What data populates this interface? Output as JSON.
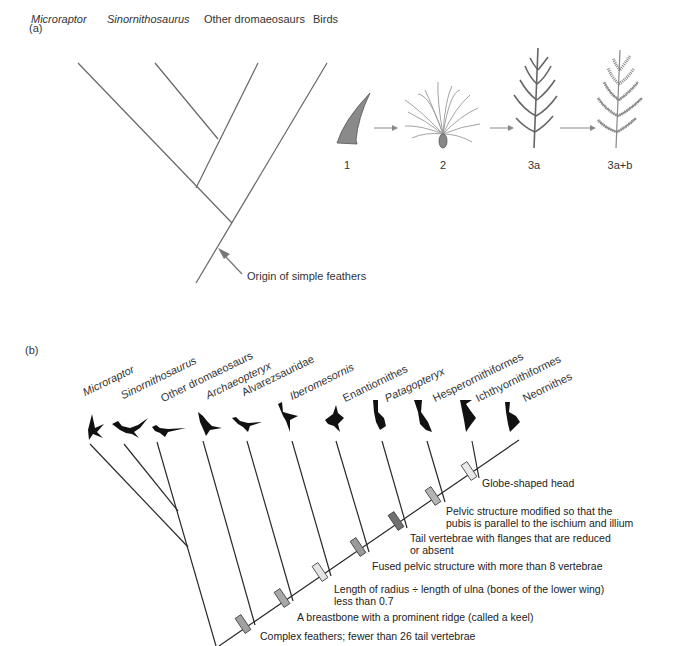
{
  "panel_a": {
    "label": "(a)",
    "taxa": [
      {
        "name": "Microraptor",
        "italic": true
      },
      {
        "name": "Sinornithosaurus",
        "italic": true
      },
      {
        "name": "Other dromaeosaurs",
        "italic": false
      },
      {
        "name": "Birds",
        "italic": false
      }
    ],
    "annotation": "Origin of simple feathers",
    "feather_stages": [
      {
        "label": "1",
        "icon": "horn-like-filament-icon"
      },
      {
        "label": "2",
        "icon": "tuft-of-barbs-icon"
      },
      {
        "label": "3a",
        "icon": "rachis-with-barbs-icon"
      },
      {
        "label": "3a+b",
        "icon": "rachis-barbs-barbules-icon"
      }
    ]
  },
  "panel_b": {
    "label": "(b)",
    "taxa": [
      {
        "name": "Microraptor",
        "italic": true
      },
      {
        "name": "Sinornithosaurus",
        "italic": true
      },
      {
        "name": "Other dromaeosaurs",
        "italic": false
      },
      {
        "name": "Archaeopteryx",
        "italic": true
      },
      {
        "name": "Alvarezsauridae",
        "italic": false
      },
      {
        "name": "Iberomesornis",
        "italic": true
      },
      {
        "name": "Enantiornithes",
        "italic": false
      },
      {
        "name": "Patagopteryx",
        "italic": true
      },
      {
        "name": "Hesperornithiformes",
        "italic": false
      },
      {
        "name": "Ichthyornithiformes",
        "italic": false
      },
      {
        "name": "Neornithes",
        "italic": false
      }
    ],
    "characters": [
      {
        "text": "Complex feathers; fewer than 26 tail vertebrae",
        "shade": "#a0a0a0"
      },
      {
        "text": "A breastbone with a prominent ridge (called a keel)",
        "shade": "#a8a8a8"
      },
      {
        "text": "Length of radius ÷ length of ulna (bones of the lower wing)",
        "text2": "less than 0.7",
        "shade": "#e4e4e4"
      },
      {
        "text": "Fused pelvic structure with more than 8 vertebrae",
        "shade": "#9a9a9a"
      },
      {
        "text": "Tail vertebrae with flanges that are reduced",
        "text2": "or absent",
        "shade": "#707070"
      },
      {
        "text": "Pelvic structure modified so that the",
        "text2": "pubis is parallel to the ischium and illium",
        "shade": "#b4b4b4"
      },
      {
        "text": "Globe-shaped head",
        "shade": "#e8e8e8"
      }
    ]
  },
  "colors": {
    "line": "#555555",
    "line_b": "#2a2a2a",
    "arrow": "#777777",
    "feather_fill": "#8a8a8a",
    "text": "#333333"
  }
}
